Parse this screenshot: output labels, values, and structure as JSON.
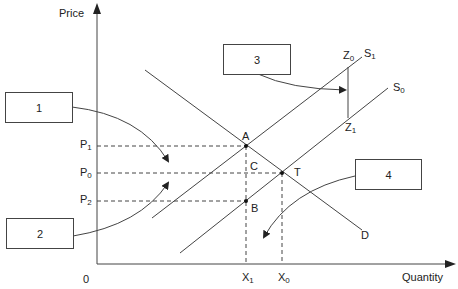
{
  "diagram": {
    "type": "supply-demand-tax-incidence",
    "axes": {
      "y_label": "Price",
      "x_label": "Quantity",
      "origin_label": "0"
    },
    "price_levels": [
      {
        "name": "P",
        "sub": "1"
      },
      {
        "name": "P",
        "sub": "0"
      },
      {
        "name": "P",
        "sub": "2"
      }
    ],
    "quantity_levels": [
      {
        "name": "X",
        "sub": "1"
      },
      {
        "name": "X",
        "sub": "0"
      }
    ],
    "curves": {
      "demand": "D",
      "supply_new": {
        "name": "S",
        "sub": "1"
      },
      "supply_old": {
        "name": "S",
        "sub": "0"
      }
    },
    "points": {
      "A": "A",
      "B": "B",
      "C": "C",
      "T": "T",
      "Z0": {
        "name": "Z",
        "sub": "0"
      },
      "Z1": {
        "name": "Z",
        "sub": "1"
      }
    },
    "callout_boxes": [
      {
        "label": "1"
      },
      {
        "label": "2"
      },
      {
        "label": "3"
      },
      {
        "label": "4"
      }
    ],
    "colors": {
      "line": "#444444",
      "text": "#222222",
      "background": "#ffffff"
    }
  }
}
